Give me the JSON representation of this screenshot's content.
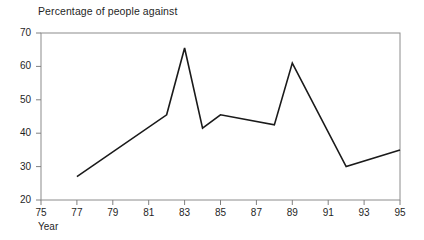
{
  "chart_data": {
    "type": "line",
    "title": "Percentage of people against",
    "xlabel": "Year",
    "ylabel": "",
    "xlim": [
      75,
      95
    ],
    "ylim": [
      20,
      70
    ],
    "grid": false,
    "legend": null,
    "x_ticks": [
      "75",
      "77",
      "79",
      "81",
      "83",
      "85",
      "87",
      "89",
      "91",
      "93",
      "95"
    ],
    "x_tick_values": [
      75,
      77,
      79,
      81,
      83,
      85,
      87,
      89,
      91,
      93,
      95
    ],
    "y_ticks": [
      "20",
      "30",
      "40",
      "50",
      "60",
      "70"
    ],
    "y_tick_values": [
      20,
      30,
      40,
      50,
      60,
      70
    ],
    "series": [
      {
        "name": "Percentage of people against",
        "color": "#1a1a1a",
        "x": [
          77,
          82,
          83,
          84,
          85,
          88,
          89,
          92,
          95
        ],
        "values": [
          27,
          45.5,
          65.5,
          41.5,
          45.5,
          42.5,
          61,
          30,
          35
        ]
      }
    ],
    "points": [
      {
        "x": 77,
        "y": 27
      },
      {
        "x": 82,
        "y": 45.5
      },
      {
        "x": 83,
        "y": 65.5
      },
      {
        "x": 84,
        "y": 41.5
      },
      {
        "x": 85,
        "y": 45.5
      },
      {
        "x": 88,
        "y": 42.5
      },
      {
        "x": 89,
        "y": 61
      },
      {
        "x": 92,
        "y": 30
      },
      {
        "x": 95,
        "y": 35
      }
    ],
    "annotations": [],
    "colors": {
      "line": "#1a1a1a",
      "axis": "#808080",
      "background": "#ffffff",
      "text": "#1f1f1f"
    }
  }
}
